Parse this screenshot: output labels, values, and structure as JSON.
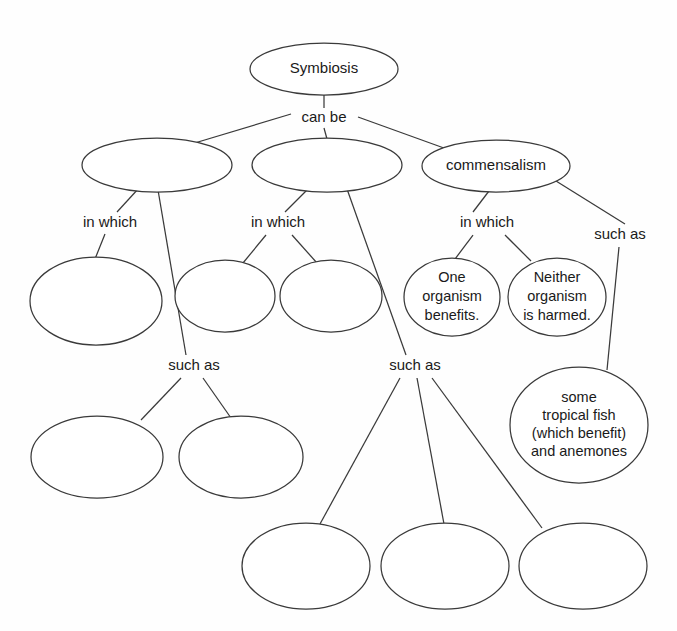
{
  "diagram": {
    "type": "concept-map",
    "background_color": "#fefefe",
    "stroke_color": "#3a3a3a",
    "text_color": "#1a1a1a"
  },
  "nodes": [
    {
      "id": "symbiosis",
      "label": "Symbiosis",
      "lines": [
        "Symbiosis"
      ],
      "filled": true,
      "cx": 324,
      "cy": 69,
      "rx": 74,
      "ry": 26
    },
    {
      "id": "type-1",
      "label": "",
      "lines": [],
      "filled": false,
      "cx": 157,
      "cy": 165,
      "rx": 75,
      "ry": 27
    },
    {
      "id": "type-2",
      "label": "",
      "lines": [],
      "filled": false,
      "cx": 327,
      "cy": 165,
      "rx": 75,
      "ry": 27
    },
    {
      "id": "commensalism",
      "label": "commensalism",
      "lines": [
        "commensalism"
      ],
      "filled": true,
      "cx": 496,
      "cy": 166,
      "rx": 74,
      "ry": 26
    },
    {
      "id": "type1-trait",
      "label": "",
      "lines": [],
      "filled": false,
      "cx": 96,
      "cy": 301,
      "rx": 66,
      "ry": 44
    },
    {
      "id": "type2-trait-a",
      "label": "",
      "lines": [],
      "filled": false,
      "cx": 225,
      "cy": 296,
      "rx": 50,
      "ry": 36
    },
    {
      "id": "type2-trait-b",
      "label": "",
      "lines": [],
      "filled": false,
      "cx": 331,
      "cy": 296,
      "rx": 51,
      "ry": 36
    },
    {
      "id": "one-organism-benefits",
      "label": "One organism benefits.",
      "lines": [
        "One",
        "organism",
        "benefits."
      ],
      "filled": true,
      "cx": 452,
      "cy": 297,
      "rx": 48,
      "ry": 39
    },
    {
      "id": "neither-organism-harmed",
      "label": "Neither organism is harmed.",
      "lines": [
        "Neither",
        "organism",
        "is harmed."
      ],
      "filled": true,
      "cx": 557,
      "cy": 297,
      "rx": 49,
      "ry": 39
    },
    {
      "id": "tropical-fish-anemones",
      "label": "some tropical fish (which benefit) and anemones",
      "lines": [
        "some",
        "tropical fish",
        "(which benefit)",
        "and anemones"
      ],
      "filled": true,
      "cx": 579,
      "cy": 425,
      "rx": 69,
      "ry": 58
    },
    {
      "id": "type1-example-a",
      "label": "",
      "lines": [],
      "filled": false,
      "cx": 97,
      "cy": 457,
      "rx": 66,
      "ry": 41
    },
    {
      "id": "type1-example-b",
      "label": "",
      "lines": [],
      "filled": false,
      "cx": 241,
      "cy": 457,
      "rx": 62,
      "ry": 41
    },
    {
      "id": "type2-example-a",
      "label": "",
      "lines": [],
      "filled": false,
      "cx": 306,
      "cy": 566,
      "rx": 64,
      "ry": 43
    },
    {
      "id": "type2-example-b",
      "label": "",
      "lines": [],
      "filled": false,
      "cx": 445,
      "cy": 566,
      "rx": 64,
      "ry": 43
    },
    {
      "id": "type2-example-c",
      "label": "",
      "lines": [],
      "filled": false,
      "cx": 583,
      "cy": 566,
      "rx": 64,
      "ry": 43
    }
  ],
  "edge_labels": [
    {
      "id": "can-be",
      "label": "can be",
      "x": 324,
      "y": 118
    },
    {
      "id": "in-which-1",
      "label": "in which",
      "x": 110,
      "y": 223
    },
    {
      "id": "in-which-2",
      "label": "in which",
      "x": 278,
      "y": 223
    },
    {
      "id": "in-which-3",
      "label": "in which",
      "x": 487,
      "y": 223
    },
    {
      "id": "such-as-left",
      "label": "such as",
      "x": 194,
      "y": 366
    },
    {
      "id": "such-as-middle",
      "label": "such as",
      "x": 415,
      "y": 366
    },
    {
      "id": "such-as-right",
      "label": "such as",
      "x": 620,
      "y": 235
    }
  ],
  "edges": [
    {
      "id": "symbiosis-to-can-be",
      "x1": 324,
      "y1": 95,
      "x2": 324,
      "y2": 108
    },
    {
      "id": "can-be-to-type-1",
      "x1": 291,
      "y1": 114,
      "x2": 188,
      "y2": 145
    },
    {
      "id": "can-be-to-type-2",
      "x1": 324,
      "y1": 128,
      "x2": 327,
      "y2": 139
    },
    {
      "id": "can-be-to-commensalism",
      "x1": 358,
      "y1": 117,
      "x2": 455,
      "y2": 152
    },
    {
      "id": "type-1-to-in-which-1",
      "x1": 139,
      "y1": 188,
      "x2": 117,
      "y2": 212
    },
    {
      "id": "in-which-1-to-type1-trait",
      "x1": 105,
      "y1": 234,
      "x2": 95,
      "y2": 259
    },
    {
      "id": "type-1-to-such-as-left",
      "x1": 158,
      "y1": 190,
      "x2": 186,
      "y2": 355
    },
    {
      "id": "such-as-left-to-example-a",
      "x1": 181,
      "y1": 378,
      "x2": 141,
      "y2": 420
    },
    {
      "id": "such-as-left-to-example-b",
      "x1": 203,
      "y1": 378,
      "x2": 231,
      "y2": 418
    },
    {
      "id": "type-2-to-in-which-2",
      "x1": 308,
      "y1": 189,
      "x2": 285,
      "y2": 212
    },
    {
      "id": "in-which-2-to-trait-a",
      "x1": 266,
      "y1": 235,
      "x2": 243,
      "y2": 263
    },
    {
      "id": "in-which-2-to-trait-b",
      "x1": 292,
      "y1": 235,
      "x2": 317,
      "y2": 263
    },
    {
      "id": "type-2-to-such-as-middle",
      "x1": 347,
      "y1": 189,
      "x2": 406,
      "y2": 355
    },
    {
      "id": "such-as-middle-to-example-a",
      "x1": 400,
      "y1": 378,
      "x2": 320,
      "y2": 524
    },
    {
      "id": "such-as-middle-to-example-b",
      "x1": 417,
      "y1": 378,
      "x2": 444,
      "y2": 524
    },
    {
      "id": "such-as-middle-to-example-c",
      "x1": 432,
      "y1": 378,
      "x2": 542,
      "y2": 528
    },
    {
      "id": "commensalism-to-in-which-3",
      "x1": 489,
      "y1": 191,
      "x2": 473,
      "y2": 212
    },
    {
      "id": "in-which-3-to-one-benefits",
      "x1": 473,
      "y1": 235,
      "x2": 455,
      "y2": 259
    },
    {
      "id": "in-which-3-to-neither-harmed",
      "x1": 505,
      "y1": 235,
      "x2": 531,
      "y2": 261
    },
    {
      "id": "commensalism-to-such-as-right",
      "x1": 556,
      "y1": 181,
      "x2": 625,
      "y2": 224
    },
    {
      "id": "such-as-right-to-tropical-fish",
      "x1": 619,
      "y1": 247,
      "x2": 607,
      "y2": 370
    }
  ]
}
